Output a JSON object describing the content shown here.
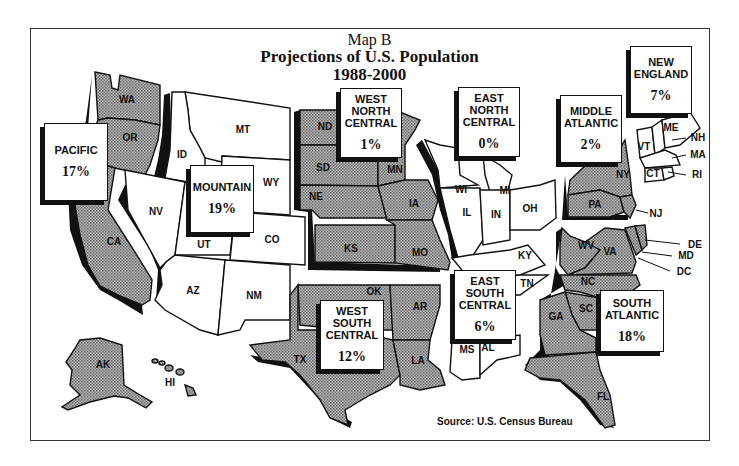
{
  "title": {
    "line1": "Map B",
    "line2": "Projections of U.S. Population",
    "line3": "1988-2000"
  },
  "source": "Source: U.S. Census Bureau",
  "colors": {
    "shaded": "#9a9a9a",
    "unshaded": "#ffffff",
    "ink": "#111111"
  },
  "regions": {
    "pacific": {
      "name": "PACIFIC",
      "pct": "17%",
      "shaded": true
    },
    "mountain": {
      "name": "MOUNTAIN",
      "pct": "19%",
      "shaded": false
    },
    "west_north_central": {
      "name": "WEST\nNORTH\nCENTRAL",
      "pct": "1%",
      "shaded": true
    },
    "east_north_central": {
      "name": "EAST\nNORTH\nCENTRAL",
      "pct": "0%",
      "shaded": false
    },
    "middle_atlantic": {
      "name": "MIDDLE\nATLANTIC",
      "pct": "2%",
      "shaded": true
    },
    "new_england": {
      "name": "NEW\nENGLAND",
      "pct": "7%",
      "shaded": false
    },
    "west_south_central": {
      "name": "WEST\nSOUTH\nCENTRAL",
      "pct": "12%",
      "shaded": true
    },
    "east_south_central": {
      "name": "EAST\nSOUTH\nCENTRAL",
      "pct": "6%",
      "shaded": false
    },
    "south_atlantic": {
      "name": "SOUTH\nATLANTIC",
      "pct": "18%",
      "shaded": true
    }
  },
  "states": {
    "WA": "WA",
    "OR": "OR",
    "CA": "CA",
    "AK": "AK",
    "HI": "HI",
    "ID": "ID",
    "MT": "MT",
    "WY": "WY",
    "NV": "NV",
    "UT": "UT",
    "CO": "CO",
    "AZ": "AZ",
    "NM": "NM",
    "ND": "ND",
    "SD": "SD",
    "NE": "NE",
    "KS": "KS",
    "MN": "MN",
    "IA": "IA",
    "MO": "MO",
    "WI": "WI",
    "MI": "MI",
    "IL": "IL",
    "IN": "IN",
    "OH": "OH",
    "NY": "NY",
    "PA": "PA",
    "NJ": "NJ",
    "VT": "VT",
    "ME": "ME",
    "NH": "NH",
    "MA": "MA",
    "CT": "CT",
    "RI": "RI",
    "OK": "OK",
    "TX": "TX",
    "AR": "AR",
    "LA": "LA",
    "KY": "KY",
    "TN": "TN",
    "MS": "MS",
    "AL": "AL",
    "WV": "WV",
    "VA": "VA",
    "DE": "DE",
    "MD": "MD",
    "DC": "DC",
    "NC": "NC",
    "SC": "SC",
    "GA": "GA",
    "FL": "FL"
  }
}
